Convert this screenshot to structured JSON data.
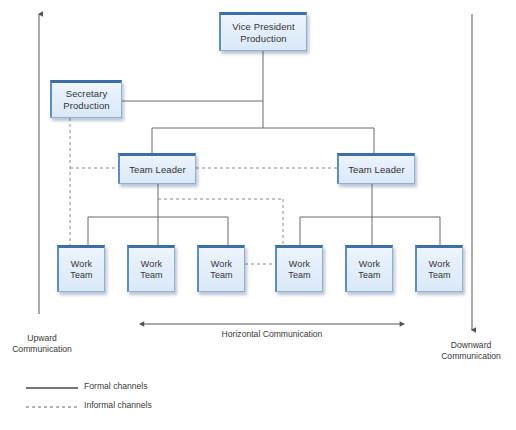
{
  "diagram": {
    "colors": {
      "node_fill_top": "#eef5fc",
      "node_fill_bottom": "#dbe9f7",
      "node_border_top": "#3c6ea8",
      "node_border": "#8fb2d4",
      "connector": "#6b6b6b",
      "axis": "#555555",
      "text": "#333333"
    },
    "nodes": {
      "vice_president": {
        "label": "Vice President\nProduction",
        "line1": "Vice President",
        "line2": "Production"
      },
      "secretary": {
        "label": "Secretary\nProduction",
        "line1": "Secretary",
        "line2": "Production"
      },
      "team_leader_left": {
        "label": "Team Leader"
      },
      "team_leader_right": {
        "label": "Team Leader"
      },
      "work_teams": [
        {
          "label": "Work\nTeam"
        },
        {
          "label": "Work\nTeam"
        },
        {
          "label": "Work\nTeam"
        },
        {
          "label": "Work\nTeam"
        },
        {
          "label": "Work\nTeam"
        },
        {
          "label": "Work\nTeam"
        }
      ]
    },
    "flow_labels": {
      "upward": "Upward\nCommunication",
      "downward": "Downward\nCommunication",
      "horizontal": "Horizontal Communication"
    },
    "legend": {
      "formal": "Formal channels",
      "informal": "Informal channels"
    }
  }
}
